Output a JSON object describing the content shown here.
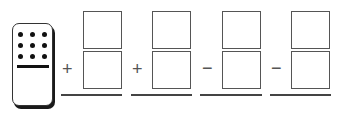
{
  "domino": {
    "top_pips": 9,
    "bottom_pips": 0,
    "pip_color": "#111111"
  },
  "columns": [
    {
      "operator": "+",
      "top_value": "",
      "bottom_value": ""
    },
    {
      "operator": "+",
      "top_value": "",
      "bottom_value": ""
    },
    {
      "operator": "−",
      "top_value": "",
      "bottom_value": ""
    },
    {
      "operator": "−",
      "top_value": "",
      "bottom_value": ""
    }
  ],
  "colors": {
    "box_border": "#555555",
    "rule": "#444444"
  }
}
